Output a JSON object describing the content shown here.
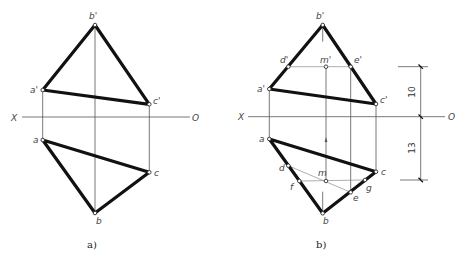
{
  "panels": [
    {
      "id": "a",
      "caption": "a)",
      "axis": {
        "left_label": "X",
        "right_label": "O"
      },
      "points": {
        "b_prime": {
          "label": "b'"
        },
        "a_prime": {
          "label": "a'"
        },
        "c_prime": {
          "label": "c'"
        },
        "a": {
          "label": "a"
        },
        "b": {
          "label": "b"
        },
        "c": {
          "label": "c"
        }
      }
    },
    {
      "id": "b",
      "caption": "b)",
      "axis": {
        "left_label": "X",
        "right_label": "O"
      },
      "points": {
        "b_prime": {
          "label": "b'"
        },
        "d_prime": {
          "label": "d'"
        },
        "m_prime": {
          "label": "m'"
        },
        "e_prime": {
          "label": "e'"
        },
        "a_prime": {
          "label": "a'"
        },
        "c_prime": {
          "label": "c'"
        },
        "a": {
          "label": "a"
        },
        "d": {
          "label": "d"
        },
        "m": {
          "label": "m"
        },
        "f": {
          "label": "f"
        },
        "g": {
          "label": "g"
        },
        "e": {
          "label": "e"
        },
        "c": {
          "label": "c"
        },
        "b": {
          "label": "b"
        }
      },
      "dimensions": {
        "upper": "10",
        "lower": "13"
      }
    }
  ]
}
